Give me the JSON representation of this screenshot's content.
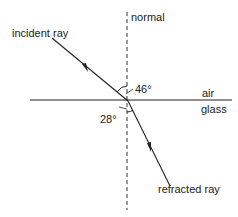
{
  "diagram": {
    "labels": {
      "normal": "normal",
      "incident_ray": "incident ray",
      "angle_incidence": "46°",
      "air": "air",
      "glass": "glass",
      "angle_refraction": "28°",
      "refracted_ray": "refracted ray"
    },
    "colors": {
      "line": "#222222",
      "background": "#ffffff"
    }
  }
}
